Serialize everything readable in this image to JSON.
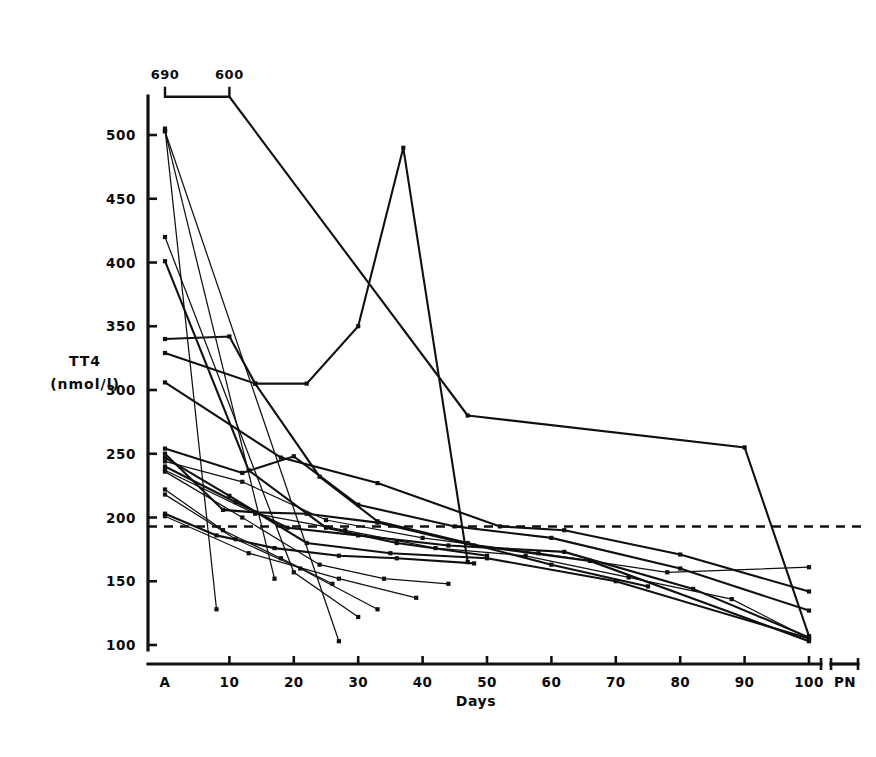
{
  "figure": {
    "background": "#ffffff",
    "ink": "#101010"
  },
  "chart_data": {
    "type": "line",
    "title": "",
    "subtitle": "",
    "xlabel": "Days",
    "ylabel": "TT4",
    "ylabel_units": "(nmol/l)",
    "ylabel_line1": "TT4",
    "ylabel_line2": "(nmol/l)",
    "grid": false,
    "legend": "none",
    "ylim": [
      100,
      530
    ],
    "yticks": [
      100,
      150,
      200,
      250,
      300,
      350,
      400,
      450,
      500
    ],
    "ytick_labels": [
      "100",
      "150",
      "200",
      "250",
      "300",
      "350",
      "400",
      "450",
      "500"
    ],
    "xticks": [
      0,
      10,
      20,
      30,
      40,
      50,
      60,
      70,
      80,
      90,
      100,
      112
    ],
    "xtick_labels": [
      "A",
      "10",
      "20",
      "30",
      "40",
      "50",
      "60",
      "70",
      "80",
      "90",
      "100",
      "PN"
    ],
    "x_category_first": "A",
    "x_category_last": "PN",
    "reference_line": {
      "value": 193,
      "style": "dashed",
      "label": ""
    },
    "offscale_annotations": [
      {
        "label": "690",
        "x": 0,
        "note": "value above plotted range, marked by bracket at top"
      },
      {
        "label": "600",
        "x": 10,
        "note": "value above plotted range, marked by bracket at top"
      }
    ],
    "offscale_bracket_y": 530,
    "series": [
      {
        "name": "patient-01",
        "weight": "thick",
        "x": [
          0,
          10,
          47,
          90,
          100
        ],
        "values": [
          690,
          600,
          280,
          255,
          107
        ]
      },
      {
        "name": "patient-02",
        "weight": "thin",
        "x": [
          0,
          8
        ],
        "values": [
          505,
          128
        ]
      },
      {
        "name": "patient-03",
        "weight": "thin",
        "x": [
          0,
          17
        ],
        "values": [
          503,
          152
        ]
      },
      {
        "name": "patient-04",
        "weight": "thin",
        "x": [
          0,
          27
        ],
        "values": [
          503,
          103
        ]
      },
      {
        "name": "patient-05",
        "weight": "thin",
        "x": [
          0,
          20,
          30
        ],
        "values": [
          420,
          157,
          122
        ]
      },
      {
        "name": "patient-06",
        "weight": "thick",
        "x": [
          0,
          13,
          25,
          36,
          50
        ],
        "values": [
          401,
          237,
          192,
          180,
          170
        ]
      },
      {
        "name": "patient-07",
        "weight": "thick",
        "x": [
          0,
          10,
          14,
          22,
          30,
          37,
          47
        ],
        "values": [
          340,
          342,
          305,
          305,
          350,
          490,
          165
        ]
      },
      {
        "name": "patient-08",
        "weight": "thick",
        "x": [
          0,
          14,
          24,
          33,
          47,
          60,
          75
        ],
        "values": [
          329,
          305,
          232,
          197,
          180,
          163,
          146
        ]
      },
      {
        "name": "patient-09",
        "weight": "thick",
        "x": [
          0,
          18,
          33,
          52,
          62,
          80,
          100
        ],
        "values": [
          306,
          247,
          227,
          193,
          190,
          171,
          142
        ]
      },
      {
        "name": "patient-10",
        "weight": "thick",
        "x": [
          0,
          12,
          20,
          30,
          45,
          60,
          80,
          100
        ],
        "values": [
          254,
          235,
          248,
          210,
          193,
          184,
          160,
          127
        ]
      },
      {
        "name": "patient-11",
        "weight": "thick",
        "x": [
          0,
          9,
          14,
          22,
          33,
          48,
          66,
          100
        ],
        "values": [
          250,
          206,
          204,
          203,
          196,
          178,
          166,
          103
        ]
      },
      {
        "name": "patient-12",
        "weight": "thick",
        "x": [
          0,
          10,
          22,
          35,
          50,
          70,
          100
        ],
        "values": [
          247,
          217,
          180,
          172,
          168,
          150,
          105
        ]
      },
      {
        "name": "patient-13",
        "weight": "thin",
        "x": [
          0,
          12,
          25,
          40,
          58,
          78,
          100
        ],
        "values": [
          244,
          228,
          198,
          184,
          172,
          157,
          161
        ]
      },
      {
        "name": "patient-14",
        "weight": "thick",
        "x": [
          0,
          11,
          19,
          30,
          44,
          62,
          82,
          100
        ],
        "values": [
          240,
          212,
          192,
          186,
          178,
          173,
          144,
          106
        ]
      },
      {
        "name": "patient-15",
        "weight": "thin",
        "x": [
          0,
          14,
          28,
          42,
          56,
          72,
          88,
          100
        ],
        "values": [
          237,
          203,
          190,
          176,
          170,
          153,
          136,
          105
        ]
      },
      {
        "name": "patient-16",
        "weight": "thin",
        "x": [
          0,
          9,
          18,
          26
        ],
        "values": [
          222,
          190,
          168,
          148
        ]
      },
      {
        "name": "patient-17",
        "weight": "thin",
        "x": [
          0,
          11,
          21,
          33
        ],
        "values": [
          218,
          183,
          160,
          128
        ]
      },
      {
        "name": "patient-18",
        "weight": "thick",
        "x": [
          0,
          8,
          17,
          27,
          36,
          48
        ],
        "values": [
          203,
          186,
          176,
          170,
          168,
          164
        ]
      },
      {
        "name": "patient-19",
        "weight": "thin",
        "x": [
          0,
          13,
          27,
          39
        ],
        "values": [
          201,
          172,
          152,
          137
        ]
      },
      {
        "name": "patient-20",
        "weight": "thin",
        "x": [
          0,
          12,
          24,
          34,
          44
        ],
        "values": [
          236,
          200,
          163,
          152,
          148
        ]
      }
    ]
  }
}
